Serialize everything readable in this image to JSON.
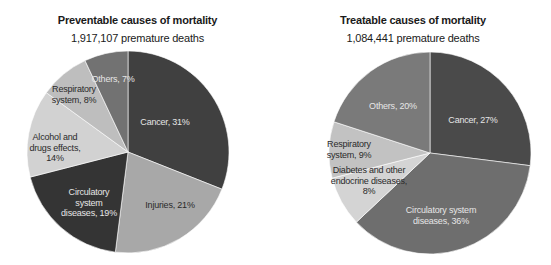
{
  "chart_data": [
    {
      "type": "pie",
      "title": "Preventable causes of mortality",
      "subtitle": "1,917,107 premature deaths",
      "start_angle": "12 o'clock",
      "direction": "clockwise",
      "slices": [
        {
          "label": "Cancer",
          "value": 31,
          "color": "#404040",
          "text": "Cancer, 31%"
        },
        {
          "label": "Injuries",
          "value": 21,
          "color": "#a8a8a8",
          "text": "Injuries, 21%"
        },
        {
          "label": "Circulatory system diseases",
          "value": 19,
          "color": "#343434",
          "text": "Circulatory\nsystem\ndiseases, 19%"
        },
        {
          "label": "Alcohol and drugs effects",
          "value": 14,
          "color": "#d2d2d2",
          "text": "Alcohol and\ndrugs effects,\n14%"
        },
        {
          "label": "Respiratory system",
          "value": 8,
          "color": "#bebebe",
          "text": "Respiratory\nsystem, 8%"
        },
        {
          "label": "Others",
          "value": 7,
          "color": "#727272",
          "text": "Others, 7%"
        }
      ]
    },
    {
      "type": "pie",
      "title": "Treatable causes of mortality",
      "subtitle": "1,084,441 premature deaths",
      "start_angle": "12 o'clock",
      "direction": "clockwise",
      "slices": [
        {
          "label": "Cancer",
          "value": 27,
          "color": "#4a4a4a",
          "text": "Cancer, 27%"
        },
        {
          "label": "Circulatory system diseases",
          "value": 36,
          "color": "#6e6e6e",
          "text": "Circulatory system\ndiseases, 36%"
        },
        {
          "label": "Diabetes and other endocrine diseases",
          "value": 8,
          "color": "#d4d4d4",
          "text": "Diabetes and other\nendocrine diseases,\n8%"
        },
        {
          "label": "Respiratory system",
          "value": 9,
          "color": "#c2c2c2",
          "text": "Respiratory\nsystem, 9%"
        },
        {
          "label": "Others",
          "value": 20,
          "color": "#7a7a7a",
          "text": "Others, 20%"
        }
      ]
    }
  ],
  "left": {
    "title": "Preventable causes of mortality",
    "subtitle": "1,917,107 premature deaths",
    "labels": {
      "cancer": "Cancer, 31%",
      "injuries": "Injuries, 21%",
      "circulatory_1": "Circulatory",
      "circulatory_2": "system",
      "circulatory_3": "diseases, 19%",
      "alcohol_1": "Alcohol and",
      "alcohol_2": "drugs effects,",
      "alcohol_3": "14%",
      "respiratory_1": "Respiratory",
      "respiratory_2": "system, 8%",
      "others": "Others, 7%"
    }
  },
  "right": {
    "title": "Treatable causes of mortality",
    "subtitle": "1,084,441 premature deaths",
    "labels": {
      "cancer": "Cancer, 27%",
      "circulatory_1": "Circulatory system",
      "circulatory_2": "diseases, 36%",
      "diabetes_1": "Diabetes and other",
      "diabetes_2": "endocrine diseases,",
      "diabetes_3": "8%",
      "respiratory_1": "Respiratory",
      "respiratory_2": "system, 9%",
      "others": "Others, 20%"
    }
  }
}
